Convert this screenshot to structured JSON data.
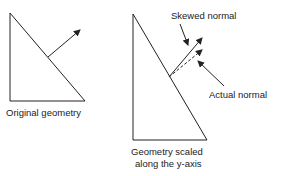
{
  "figure": {
    "left": {
      "caption": "Original geometry",
      "triangle": [
        [
          10,
          13
        ],
        [
          10,
          101
        ],
        [
          85,
          101
        ]
      ],
      "normal": {
        "from": [
          48,
          57
        ],
        "to": [
          81,
          29
        ]
      }
    },
    "right": {
      "caption_line1": "Geometry scaled",
      "caption_line2": "along the y-axis",
      "triangle": [
        [
          133,
          14
        ],
        [
          133,
          140
        ],
        [
          207,
          140
        ]
      ],
      "skewed_normal": {
        "label": "Skewed normal",
        "from": [
          169,
          77
        ],
        "to": [
          203,
          37
        ]
      },
      "actual_normal": {
        "label": "Actual normal",
        "from": [
          169,
          77
        ],
        "to": [
          203,
          49
        ]
      }
    },
    "colors": {
      "stroke": "#222222",
      "text": "#222222",
      "background": "#ffffff"
    }
  }
}
